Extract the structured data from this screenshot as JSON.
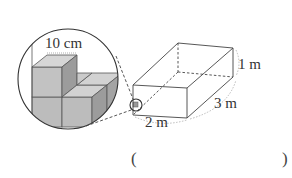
{
  "diagram": {
    "magnifier_label": "10 cm",
    "box_dimensions": {
      "height": "1 m",
      "depth": "3 m",
      "width": "2 m"
    },
    "answer_blank": {
      "open": "(",
      "close": ")"
    }
  },
  "colors": {
    "line": "#444444",
    "cube_top": "#d4d4d4",
    "cube_front": "#bcbcbc",
    "cube_side": "#9a9a9a",
    "dotted": "#aaaaaa"
  }
}
